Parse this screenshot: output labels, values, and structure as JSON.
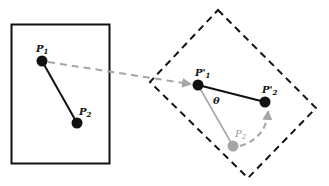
{
  "diagram": {
    "colors": {
      "solid": "#111111",
      "dashed_frame": "#111111",
      "translation_arrow": "#a6a6a6",
      "ghost_point": "#a6a6a6",
      "background": "#ffffff"
    },
    "source_frame": {
      "style": "solid rectangle",
      "x1": 11,
      "y1": 24,
      "x2": 110,
      "y2": 164
    },
    "target_frame": {
      "style": "dashed rotated rectangle",
      "corners": [
        [
          218,
          10
        ],
        [
          316,
          108
        ],
        [
          248,
          178
        ],
        [
          150,
          82
        ]
      ]
    },
    "points": {
      "p1": {
        "label": "P",
        "sub": "1",
        "x": 42,
        "y": 61
      },
      "p2": {
        "label": "P",
        "sub": "2",
        "x": 77,
        "y": 123
      },
      "p1_prime": {
        "label": "P'",
        "sub": "1",
        "x": 198,
        "y": 85
      },
      "p2_prime": {
        "label": "P'",
        "sub": "2",
        "x": 265,
        "y": 102
      },
      "p2_ghost": {
        "label": "P",
        "sub": "2",
        "x": 233,
        "y": 146
      }
    },
    "angle_label": "θ",
    "arrows": [
      {
        "name": "translation",
        "from": "P1",
        "to": "P'1",
        "style": "dashed gray"
      },
      {
        "name": "rotation",
        "from": "P2 (ghost)",
        "to": "P'2",
        "style": "dashed gray curved"
      }
    ]
  }
}
